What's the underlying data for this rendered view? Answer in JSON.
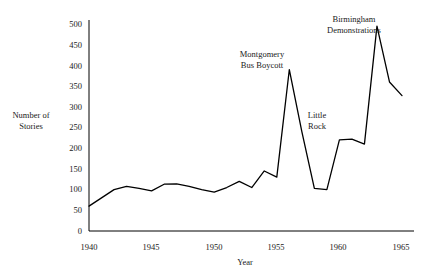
{
  "chart_data": {
    "type": "line",
    "title": "",
    "xlabel": "Year",
    "ylabel": "Number of Stories",
    "ylabel_lines": [
      "Number of",
      "Stories"
    ],
    "xlim": [
      1940,
      1965
    ],
    "ylim": [
      0,
      500
    ],
    "ytick_labels": [
      "0",
      "50",
      "100",
      "150",
      "200",
      "250",
      "300",
      "350",
      "400",
      "450",
      "500"
    ],
    "ytick_values": [
      0,
      50,
      100,
      150,
      200,
      250,
      300,
      350,
      400,
      450,
      500
    ],
    "xtick_labels": [
      "1940",
      "1945",
      "1950",
      "1955",
      "1960",
      "1965"
    ],
    "xtick_values": [
      1940,
      1945,
      1950,
      1955,
      1960,
      1965
    ],
    "grid": false,
    "legend": false,
    "line_color": "#000000",
    "series": [
      {
        "name": "Number of Stories",
        "x": [
          1940,
          1941,
          1942,
          1943,
          1944,
          1945,
          1946,
          1947,
          1948,
          1949,
          1950,
          1951,
          1952,
          1953,
          1954,
          1955,
          1956,
          1957,
          1958,
          1959,
          1960,
          1961,
          1962,
          1963,
          1964,
          1965
        ],
        "values": [
          60,
          80,
          100,
          108,
          103,
          97,
          113,
          114,
          108,
          100,
          94,
          105,
          120,
          105,
          145,
          130,
          390,
          240,
          103,
          100,
          220,
          222,
          210,
          495,
          360,
          327
        ]
      }
    ],
    "annotations": [
      {
        "text": "Montgomery Bus Boycott",
        "lines": [
          "Montgomery",
          "Bus Boycott"
        ],
        "x": 1956,
        "y": 390
      },
      {
        "text": "Little Rock",
        "lines": [
          "Little",
          "Rock"
        ],
        "x": 1957,
        "y": 240
      },
      {
        "text": "Birmingham Demonstrations",
        "lines": [
          "Birmingham",
          "Demonstrations"
        ],
        "x": 1963,
        "y": 495
      }
    ]
  }
}
